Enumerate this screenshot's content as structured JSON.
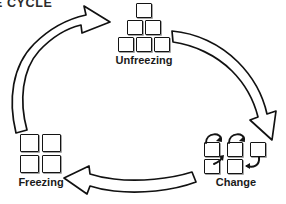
{
  "title": "NGE CYCLE",
  "colors": {
    "background": "#ffffff",
    "outline": "#141414",
    "text": "#1a1a1a",
    "title_text": "#2b2b2b",
    "arrow_fill": "#ffffff",
    "arrow_stroke": "#111111"
  },
  "diagram": {
    "type": "cycle",
    "direction": "clockwise",
    "stage_count": 3,
    "stages": [
      {
        "id": "unfreezing",
        "label": "Unfreezing",
        "icon": "pyramid-squares-icon",
        "icon_description": "pyramid of six squares arranged 1-2-3",
        "square_count": 6,
        "position": "top-center"
      },
      {
        "id": "change",
        "label": "Change",
        "icon": "rearranging-squares-icon",
        "icon_description": "five squares with curved swap arrows between them",
        "square_count": 5,
        "position": "bottom-right"
      },
      {
        "id": "freezing",
        "label": "Freezing",
        "icon": "grid-squares-icon",
        "icon_description": "four squares arranged in a 2 by 2 grid",
        "square_count": 4,
        "position": "bottom-left"
      }
    ],
    "arrows": [
      {
        "id": "arrow-freezing-to-unfreezing",
        "name": "curved-arrow-up-right-icon",
        "from": "freezing",
        "to": "unfreezing",
        "side": "left"
      },
      {
        "id": "arrow-unfreezing-to-change",
        "name": "curved-arrow-down-right-icon",
        "from": "unfreezing",
        "to": "change",
        "side": "right"
      },
      {
        "id": "arrow-change-to-freezing",
        "name": "curved-arrow-left-icon",
        "from": "change",
        "to": "freezing",
        "side": "bottom"
      }
    ]
  }
}
